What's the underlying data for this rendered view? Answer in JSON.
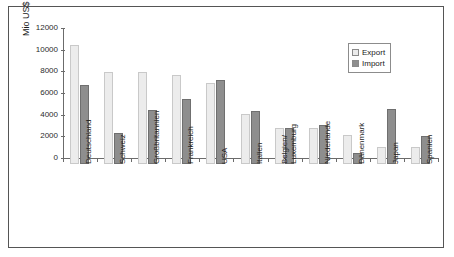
{
  "chart_data": {
    "type": "bar",
    "title": "",
    "xlabel": "",
    "ylabel": "Mio US$",
    "ylim": [
      0,
      12000
    ],
    "yticks": [
      0,
      2000,
      4000,
      6000,
      8000,
      10000,
      12000
    ],
    "grid": false,
    "legend_position": "top-right",
    "categories": [
      "Deutschland",
      "Schweiz",
      "Großbritannien",
      "Frankreich",
      "USA",
      "Italien",
      "Belgien/ Luxemburg",
      "Niederlande",
      "Dänenmark",
      "Japan",
      "Spanien"
    ],
    "category_lines": [
      [
        "Deutschland"
      ],
      [
        "Schweiz"
      ],
      [
        "Großbritannien"
      ],
      [
        "Frankreich"
      ],
      [
        "USA"
      ],
      [
        "Italien"
      ],
      [
        "Belgien/",
        "Luxemburg"
      ],
      [
        "Niederlande"
      ],
      [
        "Dänenmark"
      ],
      [
        "Japan"
      ],
      [
        "Spanien"
      ]
    ],
    "series": [
      {
        "name": "Export",
        "color": "#ececec",
        "values": [
          11000,
          8500,
          8500,
          8200,
          7500,
          4600,
          3300,
          3300,
          2700,
          1600,
          1600
        ]
      },
      {
        "name": "Import",
        "color": "#8e8e8e",
        "values": [
          7300,
          2900,
          5000,
          6000,
          7800,
          4900,
          3300,
          3600,
          1000,
          5100,
          2600
        ]
      }
    ]
  },
  "legend": {
    "items": [
      {
        "label": "Export"
      },
      {
        "label": "Import"
      }
    ]
  }
}
